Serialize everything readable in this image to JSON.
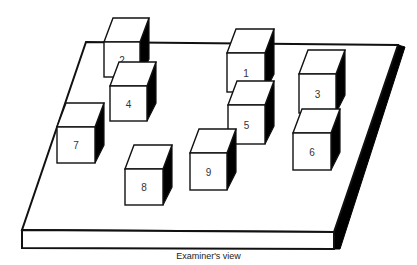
{
  "caption": "Examiner's view",
  "colors": {
    "line": "#111111",
    "shade": "#000000",
    "face": "#ffffff"
  },
  "board": {
    "top": [
      [
        86,
        42
      ],
      [
        398,
        45
      ],
      [
        334,
        232
      ],
      [
        22,
        230
      ]
    ],
    "front": [
      [
        22,
        230
      ],
      [
        334,
        232
      ],
      [
        334,
        249
      ],
      [
        22,
        248
      ]
    ],
    "side": [
      [
        334,
        232
      ],
      [
        398,
        45
      ],
      [
        405,
        47
      ],
      [
        340,
        249
      ],
      [
        334,
        249
      ]
    ]
  },
  "cubes": [
    {
      "label": "2",
      "x": 104,
      "y": 42,
      "w": 36,
      "h": 35
    },
    {
      "label": "1",
      "x": 227,
      "y": 53,
      "w": 38,
      "h": 39
    },
    {
      "label": "3",
      "x": 299,
      "y": 74,
      "w": 37,
      "h": 39
    },
    {
      "label": "4",
      "x": 110,
      "y": 86,
      "w": 37,
      "h": 35
    },
    {
      "label": "5",
      "x": 228,
      "y": 105,
      "w": 37,
      "h": 39
    },
    {
      "label": "7",
      "x": 57,
      "y": 127,
      "w": 38,
      "h": 36
    },
    {
      "label": "6",
      "x": 293,
      "y": 133,
      "w": 38,
      "h": 37
    },
    {
      "label": "9",
      "x": 190,
      "y": 153,
      "w": 37,
      "h": 37
    },
    {
      "label": "8",
      "x": 125,
      "y": 169,
      "w": 38,
      "h": 36
    }
  ]
}
